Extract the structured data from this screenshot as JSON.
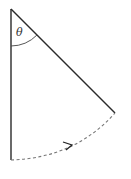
{
  "diagram": {
    "labels": {
      "angle": "θ"
    },
    "elements": {
      "pivot": [
        11,
        9
      ],
      "vertical_end": [
        11,
        160
      ],
      "swung_end": [
        115,
        113
      ],
      "arc_style": "dashed",
      "arrow_direction": "toward-swung-position"
    },
    "colors": {
      "line": "#2a2a2a",
      "dashed": "#777777"
    }
  }
}
